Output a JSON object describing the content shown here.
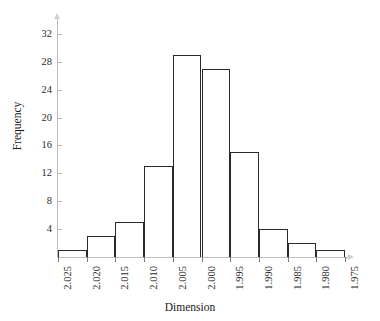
{
  "chart_data": {
    "type": "bar",
    "title": "",
    "subtitle": "",
    "xlabel": "Dimension",
    "ylabel": "Frequency",
    "grid": false,
    "legend": null,
    "orientation": "vertical",
    "note": "Histogram of a measured dimension; x axis runs from 2.025 down to 1.975 in steps of 0.005. Bars span between adjacent tick marks.",
    "categories": [
      "2.025-2.020",
      "2.020-2.015",
      "2.015-2.010",
      "2.010-2.005",
      "2.005-2.000",
      "2.000-1.995",
      "1.995-1.990",
      "1.990-1.985",
      "1.985-1.980",
      "1.980-1.975"
    ],
    "values": [
      1,
      3,
      5,
      13,
      29,
      27,
      15,
      4,
      2,
      1
    ],
    "bin_edges": [
      "2.025",
      "2.020",
      "2.015",
      "2.010",
      "2.005",
      "2.000",
      "1.995",
      "1.990",
      "1.985",
      "1.980",
      "1.975"
    ],
    "xticklabels": [
      "2.025",
      "2.020",
      "2.015",
      "2.010",
      "2.005",
      "2.000",
      "1.995",
      "1.990",
      "1.985",
      "1.980",
      "1.975"
    ],
    "yticks": [
      4,
      8,
      12,
      16,
      20,
      24,
      28,
      32
    ],
    "yticklabels": [
      "4",
      "8",
      "12",
      "16",
      "20",
      "24",
      "28",
      "32"
    ],
    "ylim": [
      0,
      34
    ],
    "xlim_labels": [
      "2.025",
      "1.975"
    ],
    "bar_edge_color": "#2a2a2a",
    "bar_fill_color": "transparent",
    "axis_color": "#bdbdbd",
    "text_color": "#1a1a1a"
  }
}
